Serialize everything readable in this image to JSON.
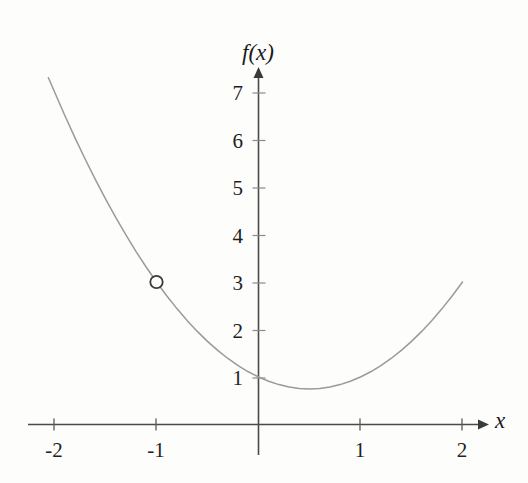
{
  "figure": {
    "background_color": "#fdfdfc",
    "ink_color": "#555555",
    "text_color": "#1f1f1f",
    "y_axis_label": "f(x)",
    "x_axis_label": "x"
  },
  "chart_data": {
    "type": "line",
    "title": "",
    "subtitle": "",
    "xlabel": "x",
    "ylabel": "f(x)",
    "xlim": [
      -2.25,
      2.35
    ],
    "ylim": [
      -0.55,
      7.6
    ],
    "grid": false,
    "legend": null,
    "function": "f(x) = x^2 - x + 1",
    "x_ticks": [
      -2,
      -1,
      1,
      2
    ],
    "x_tick_labels": [
      "-2",
      "-1",
      "1",
      "2"
    ],
    "y_ticks": [
      1,
      2,
      3,
      4,
      5,
      6,
      7
    ],
    "y_tick_labels": [
      "1",
      "2",
      "3",
      "4",
      "5",
      "6",
      "7"
    ],
    "series": [
      {
        "name": "f(x) = x^2 - x + 1",
        "x": [
          -2.06,
          -1.9,
          -1.8,
          -1.7,
          -1.6,
          -1.5,
          -1.4,
          -1.3,
          -1.2,
          -1.1,
          -1.0,
          -0.9,
          -0.8,
          -0.7,
          -0.6,
          -0.5,
          -0.4,
          -0.3,
          -0.2,
          -0.1,
          0.0,
          0.1,
          0.2,
          0.3,
          0.4,
          0.5,
          0.6,
          0.7,
          0.8,
          0.9,
          1.0,
          1.1,
          1.2,
          1.3,
          1.4,
          1.5,
          1.6,
          1.7,
          1.8,
          1.9,
          2.0
        ],
        "y": [
          7.3,
          6.51,
          6.04,
          5.59,
          5.16,
          4.75,
          4.36,
          3.99,
          3.64,
          3.31,
          3.0,
          2.71,
          2.44,
          2.19,
          1.96,
          1.75,
          1.56,
          1.39,
          1.24,
          1.11,
          1.0,
          0.91,
          0.84,
          0.79,
          0.76,
          0.75,
          0.76,
          0.79,
          0.84,
          0.91,
          1.0,
          1.11,
          1.24,
          1.39,
          1.56,
          1.75,
          1.96,
          2.19,
          2.44,
          2.71,
          3.0
        ]
      }
    ],
    "markers": [
      {
        "type": "open-circle",
        "x": -1,
        "y": 3,
        "label": "hole at (-1, 3)"
      }
    ],
    "vertex": {
      "x": 0.5,
      "y": 0.75
    },
    "annotations": []
  }
}
